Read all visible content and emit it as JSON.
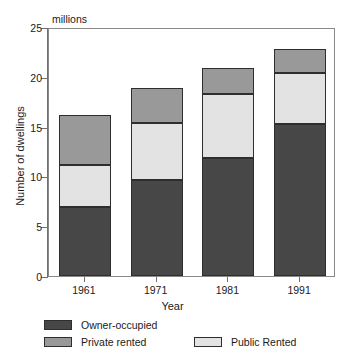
{
  "chart_data": {
    "type": "bar",
    "subtype": "stacked-bar",
    "title": "",
    "units_label": "millions",
    "xlabel": "Year",
    "ylabel": "Number of dwellings",
    "categories": [
      "1961",
      "1971",
      "1981",
      "1991"
    ],
    "ylim": [
      0,
      25
    ],
    "yticks": [
      0,
      5,
      10,
      15,
      20,
      25
    ],
    "ytick_labels": [
      "0",
      "5",
      "10",
      "15",
      "20",
      "25"
    ],
    "grid": false,
    "legend_position": "below-plot",
    "stack_order_bottom_to_top": [
      "Owner-occupied",
      "Public Rented",
      "Private rented"
    ],
    "series": [
      {
        "name": "Owner-occupied",
        "color": "#474747",
        "values": [
          6.9,
          9.6,
          11.8,
          15.3
        ]
      },
      {
        "name": "Public Rented",
        "color": "#e3e3e3",
        "values": [
          4.2,
          5.8,
          6.5,
          5.1
        ]
      },
      {
        "name": "Private rented",
        "color": "#999999",
        "values": [
          5.1,
          3.5,
          2.6,
          2.4
        ]
      }
    ],
    "totals": [
      16.2,
      18.9,
      20.9,
      22.8
    ],
    "annotations": []
  },
  "legend": {
    "entries": [
      {
        "label": "Owner-occupied",
        "color": "#474747"
      },
      {
        "label": "Private rented",
        "color": "#999999"
      },
      {
        "label": "Public Rented",
        "color": "#e3e3e3"
      }
    ]
  },
  "colors": {
    "owner_occupied": "#474747",
    "private_rented": "#999999",
    "public_rented": "#e3e3e3",
    "axis": "#6f6f6f",
    "bar_outline": "#2e2e2e",
    "frame": "#8a8a8a",
    "text": "#1a1a1a",
    "background": "#ffffff"
  }
}
